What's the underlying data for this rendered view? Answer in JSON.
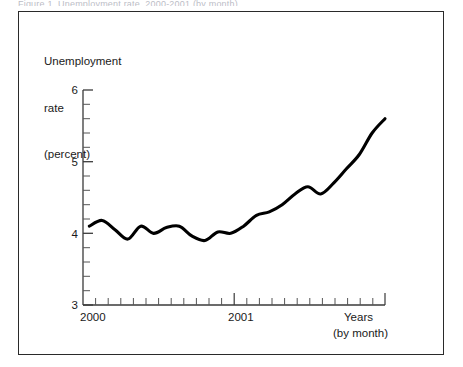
{
  "figure": {
    "caption_remnant": "Figure 1.  Unemployment rate, 2000-2001 (by month)",
    "panel_border_color": "#2a2a2a",
    "background_color": "#ffffff",
    "line_color": "#000000"
  },
  "axis_title": {
    "line1": "Unemployment",
    "line2": "rate",
    "line3": "(percent)"
  },
  "y_axis": {
    "labels": [
      "6",
      "5",
      "4",
      "3"
    ],
    "min": 3,
    "max": 6,
    "minor_ticks_between": 4
  },
  "x_axis": {
    "labels": [
      "2000",
      "2001"
    ],
    "title_line1": "Years",
    "title_line2": "(by month)"
  },
  "chart_data": {
    "type": "line",
    "title": "",
    "subtitle": "",
    "xlabel": "Years (by month)",
    "ylabel": "Unemployment rate (percent)",
    "xlim": [
      "2000-01",
      "2001-12"
    ],
    "ylim": [
      3,
      6
    ],
    "y_ticks": [
      3,
      4,
      5,
      6
    ],
    "y_minor_tick_step": 0.2,
    "grid": false,
    "legend": "none",
    "x_tick_labels_shown": [
      "2000",
      "2001"
    ],
    "x": [
      "2000-01",
      "2000-02",
      "2000-03",
      "2000-04",
      "2000-05",
      "2000-06",
      "2000-07",
      "2000-08",
      "2000-09",
      "2000-10",
      "2000-11",
      "2000-12",
      "2001-01",
      "2001-02",
      "2001-03",
      "2001-04",
      "2001-05",
      "2001-06",
      "2001-07",
      "2001-08",
      "2001-09",
      "2001-10",
      "2001-11",
      "2001-12"
    ],
    "series": [
      {
        "name": "Unemployment rate",
        "values": [
          4.1,
          4.18,
          4.05,
          3.92,
          4.1,
          4.0,
          4.08,
          4.1,
          3.96,
          3.9,
          4.02,
          4.0,
          4.1,
          4.25,
          4.3,
          4.4,
          4.55,
          4.65,
          4.55,
          4.7,
          4.9,
          5.1,
          5.4,
          5.6
        ]
      }
    ]
  }
}
